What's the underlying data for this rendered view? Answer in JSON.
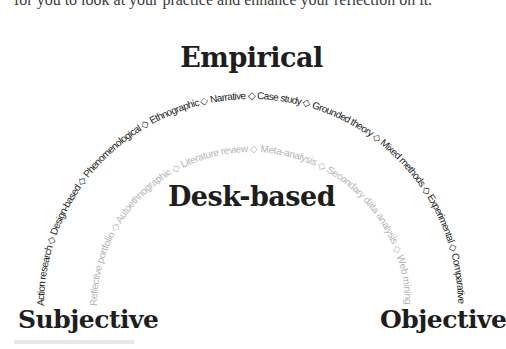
{
  "intro_text": "for you to look at your practice and enhance your reflection on it.",
  "titles": {
    "empirical": "Empirical",
    "desk_based": "Desk-based",
    "subjective": "Subjective",
    "objective": "Objective"
  },
  "separator_glyph": "◇",
  "outer_arc": {
    "label": "Empirical",
    "color": "#222222",
    "items": [
      "Action research",
      "Design-based",
      "Phenomenological",
      "Ethnographic",
      "Narrative",
      "Case study",
      "Grounded theory",
      "Mixed methods",
      "Experimental",
      "Comparative"
    ],
    "text": "Action research ◇ Design-based ◇ Phenomenological ◇ Ethnographic ◇ Narrative ◇ Case study ◇ Grounded theory ◇ Mixed methods ◇ Experimental ◇ Comparative"
  },
  "inner_arc": {
    "label": "Desk-based",
    "color": "#b4b4b4",
    "items": [
      "Reflective portfolio",
      "Autoethnographic",
      "Literature review",
      "Meta-analysis",
      "Secondary data analysis",
      "Web mining"
    ],
    "text": "Reflective portfolio ◇ Autoethnographic ◇ Literature review ◇ Meta-analysis ◇ Secondary data analysis ◇ Web mining"
  },
  "axis": {
    "left": "Subjective",
    "right": "Objective"
  }
}
